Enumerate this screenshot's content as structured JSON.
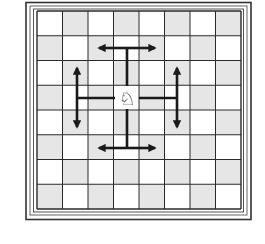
{
  "diagram": {
    "board": {
      "files": 8,
      "ranks": 8,
      "light_color": "#ffffff",
      "dark_color": "#e6e6e6",
      "line_color": "#2a2a2a",
      "top_left_square": "light"
    },
    "piece": {
      "name": "knight",
      "color": "white",
      "glyph": "♘",
      "col": 3,
      "row": 3
    },
    "arrows": [
      {
        "name": "up",
        "branch": "horizontal",
        "description": "two squares up, then one left or right"
      },
      {
        "name": "down",
        "branch": "horizontal",
        "description": "two squares down, then one left or right"
      },
      {
        "name": "left",
        "branch": "vertical",
        "description": "two squares left, then one up or down"
      },
      {
        "name": "right",
        "branch": "vertical",
        "description": "two squares right, then one up or down"
      }
    ],
    "arrow_color": "#1a1a1a"
  }
}
